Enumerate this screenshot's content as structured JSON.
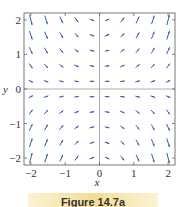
{
  "chart_data": {
    "type": "vector_field",
    "title": "",
    "field_description": "Direction field with slope proportional to x*y (vectors ~ <1, x y>, normalized length)",
    "xlabel": "x",
    "ylabel": "y",
    "xlim": [
      -2.2,
      2.2
    ],
    "ylim": [
      -2.2,
      2.2
    ],
    "x_ticks": [
      -2,
      -1,
      0,
      1,
      2
    ],
    "y_ticks": [
      -2,
      -1,
      0,
      1,
      2
    ],
    "x_tick_labels": [
      "−2",
      "−1",
      "0",
      "1",
      "2"
    ],
    "y_tick_labels": [
      "−2",
      "−1",
      "0",
      "1",
      "2"
    ],
    "grid_points_x": [
      -2,
      -1.556,
      -1.111,
      -0.667,
      -0.222,
      0.222,
      0.667,
      1.111,
      1.556,
      2
    ],
    "grid_points_y": [
      -2,
      -1.556,
      -1.111,
      -0.667,
      -0.222,
      0.222,
      0.667,
      1.111,
      1.556,
      2
    ],
    "grid": false,
    "axes_through_origin": true,
    "arrow_color": "#2f5fa8",
    "axis_color": "#999999",
    "frame_color": "#555555"
  },
  "caption": "Figure 14.7a"
}
